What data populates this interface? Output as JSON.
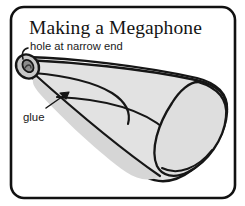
{
  "panel": {
    "title": "Making a Megaphone",
    "border_color": "#111111",
    "background_color": "#ffffff"
  },
  "annotations": {
    "hole_label": "hole at narrow end",
    "glue_label": "glue"
  },
  "illustration": {
    "subject": "rolled paper megaphone cone",
    "body_fill": "#e2e2e2",
    "shade_fill": "#d2d2d2",
    "hole_fill": "#8f8f8f",
    "outline_color": "#161616"
  }
}
